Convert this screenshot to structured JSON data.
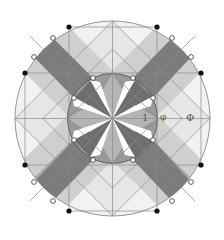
{
  "diagram": {
    "type": "golden-ratio sacred geometry mandala",
    "center": [
      112.5,
      118.5
    ],
    "outer_circle_radius": 97.5,
    "inner_circle_radius": 45,
    "labels": {
      "one": "1",
      "phi_small": "φ",
      "phi_large": "Φ"
    },
    "colors": {
      "line": "#8a8a8a",
      "dark_band": "#7c7c7c",
      "mid_band": "#a9a9a9",
      "light_band": "#cfcfcf",
      "pale": "#e9e9e9",
      "background": "#ffffff",
      "black_dot": "#111111",
      "white_dot": "#ffffff"
    },
    "outer_black_dots": [
      [
        69,
        27
      ],
      [
        157,
        27
      ],
      [
        25,
        73
      ],
      [
        201,
        73
      ],
      [
        25,
        165
      ],
      [
        201,
        165
      ],
      [
        69,
        211
      ],
      [
        157,
        211
      ]
    ],
    "outer_white_dots": [
      [
        53,
        38
      ],
      [
        34,
        57
      ],
      [
        172,
        38
      ],
      [
        191,
        57
      ],
      [
        34,
        182
      ],
      [
        53,
        201
      ],
      [
        172,
        201
      ],
      [
        191,
        182
      ]
    ],
    "inner_white_dots": [
      [
        93,
        78
      ],
      [
        133,
        78
      ],
      [
        74,
        98
      ],
      [
        153,
        98
      ],
      [
        74,
        140
      ],
      [
        153,
        140
      ],
      [
        93,
        160
      ],
      [
        133,
        160
      ]
    ]
  }
}
